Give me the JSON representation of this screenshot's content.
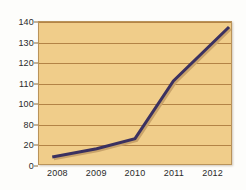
{
  "chart_data": {
    "type": "line",
    "title": "",
    "subtitle": "",
    "xlabel": "",
    "ylabel": "",
    "categories": [
      "2008",
      "2009",
      "2010",
      "2011",
      "2012"
    ],
    "x": [
      2008,
      2009,
      2010,
      2011,
      2012
    ],
    "values": [
      7,
      15,
      25,
      82,
      135
    ],
    "series": [
      {
        "name": "",
        "values": [
          7,
          15,
          25,
          82,
          135
        ]
      }
    ],
    "ylim": [
      0,
      140
    ],
    "xlim": [
      2008,
      2012
    ],
    "ytick_labels": [
      "140",
      "130",
      "120",
      "110",
      "100",
      "80",
      "20",
      "0"
    ],
    "ytick_positions": [
      140,
      130,
      120,
      110,
      100,
      90,
      80,
      0
    ],
    "xtick_labels": [
      "2008",
      "2009",
      "2010",
      "2011",
      "2012"
    ],
    "grid": "horizontal",
    "legend": "none",
    "annotations": [],
    "colors": {
      "plot_background": "#f0cd8a",
      "gridline": "#a8763a",
      "plot_border": "#b9935a",
      "line": "#3b3160",
      "line_shadow": "#c9a36a",
      "page_background": "#fdfdfb",
      "tick_text": "#2a2a2a"
    }
  }
}
